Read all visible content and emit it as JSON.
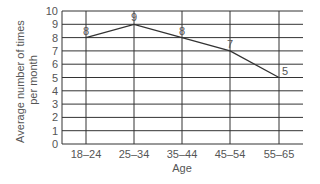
{
  "chart_data": {
    "type": "line",
    "title": "",
    "xlabel": "Age",
    "ylabel": "Average number of times per month",
    "ylabel_lines": [
      "Average number of times",
      "per month"
    ],
    "categories": [
      "18–24",
      "25–34",
      "35–44",
      "45–54",
      "55–65"
    ],
    "values": [
      8,
      9,
      8,
      7,
      5
    ],
    "data_labels": [
      "8",
      "9",
      "8",
      "7",
      "5"
    ],
    "ylim": [
      0,
      10
    ],
    "yticks": [
      0,
      1,
      2,
      3,
      4,
      5,
      6,
      7,
      8,
      9,
      10
    ],
    "grid": true,
    "legend": null,
    "colors": {
      "line": "#333333",
      "grid": "#333333",
      "text": "#555555"
    }
  }
}
